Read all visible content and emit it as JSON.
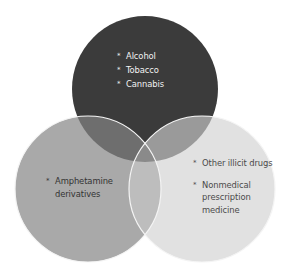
{
  "diagram": {
    "type": "venn",
    "circles": [
      {
        "id": "top",
        "color": "#3b3b3b",
        "items": [
          "Alcohol",
          "Tobacco",
          "Cannabis"
        ]
      },
      {
        "id": "left",
        "color": "#a9a9a9",
        "items": [
          "Amphetamine derivatives"
        ]
      },
      {
        "id": "right",
        "color": "#e1e1e1",
        "items": [
          "Other illicit drugs",
          "Nonmedical prescription medicine"
        ]
      }
    ],
    "bullet_glyph": "*"
  }
}
